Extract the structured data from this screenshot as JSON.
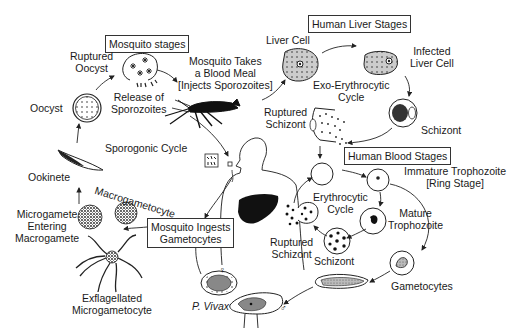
{
  "section_boxes": {
    "mosquito_stages": "Mosquito stages",
    "human_liver_stages": "Human Liver Stages",
    "human_blood_stages": "Human Blood Stages",
    "mosquito_ingests": [
      "Mosquito Ingests",
      "Gametocytes"
    ]
  },
  "labels": {
    "ruptured_oocyst": [
      "Ruptured",
      "Oocyst"
    ],
    "oocyst": "Oocyst",
    "release_sporozoites": [
      "Release of",
      "Sporozoites"
    ],
    "blood_meal": [
      "Mosquito Takes",
      "a Blood Meal",
      "[Injects Sporozoites]"
    ],
    "sporogonic_cycle": "Sporogonic Cycle",
    "ookinete": "Ookinete",
    "macrogametocyte": "Macrogametocyte",
    "microgamete_entering": [
      "Microgamete",
      "Entering",
      "Macrogamete"
    ],
    "exflagellated": [
      "Exflagellated",
      "Microgametocyte"
    ],
    "p_vivax": "P. Vivax",
    "liver_cell": "Liver Cell",
    "infected_liver_cell": [
      "Infected",
      "Liver Cell"
    ],
    "exo_erythrocytic": [
      "Exo-Erythrocytic",
      "Cycle"
    ],
    "schizont_liver": "Schizont",
    "ruptured_schizont_liver": [
      "Ruptured",
      "Schizont"
    ],
    "immature_trophozoite": [
      "Immature Trophozoite",
      "[Ring Stage]"
    ],
    "erythrocytic_cycle": [
      "Erythrocytic",
      "Cycle"
    ],
    "mature_trophozoite": [
      "Mature",
      "Trophozoite"
    ],
    "ruptured_schizont_blood": [
      "Ruptured",
      "Schizont"
    ],
    "schizont_blood": "Schizont",
    "gametocytes": "Gametocytes"
  },
  "symbols": {
    "female": "♀",
    "male": "♂"
  }
}
